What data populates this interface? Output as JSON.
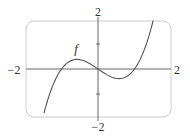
{
  "chart_data": {
    "type": "line",
    "title": "",
    "xlabel": "",
    "ylabel": "",
    "xlim": [
      -2,
      2
    ],
    "ylim": [
      -2,
      2
    ],
    "grid": false,
    "axis_tick_labels": {
      "x_left": "−2",
      "x_right": "2",
      "y_top": "2",
      "y_bottom": "−2"
    },
    "y_ticks": [
      -1,
      1
    ],
    "series": [
      {
        "name": "f",
        "label": "f",
        "expression": "x^3 - x",
        "x": [
          -1.48,
          -1.25,
          -1.0,
          -0.75,
          -0.577,
          -0.25,
          0,
          0.25,
          0.577,
          0.75,
          1.0,
          1.25,
          1.51
        ],
        "y": [
          -1.76,
          -0.7,
          0.0,
          0.33,
          0.385,
          0.23,
          0,
          -0.23,
          -0.385,
          -0.33,
          0.0,
          0.7,
          1.93
        ]
      }
    ],
    "annotations": [
      {
        "text": "f",
        "x": -0.6,
        "y": 0.8
      }
    ],
    "colors": {
      "curve": "#555555",
      "axes": "#666666",
      "frame": "#cccccc",
      "text": "#333333"
    }
  }
}
